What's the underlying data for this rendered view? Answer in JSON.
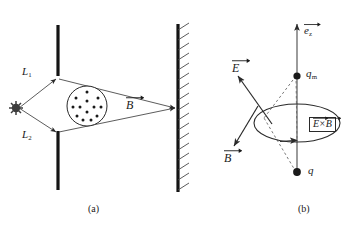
{
  "figure": {
    "background_color": "#ffffff",
    "ink_color": "#1a1a1a"
  },
  "panel_a": {
    "caption": "(a)",
    "labels": {
      "path_1": "L",
      "path_1_sub": "1",
      "path_2": "L",
      "path_2_sub": "2",
      "field_b": "B"
    },
    "elements": {
      "source_name": "point-source-burst",
      "barrier_name": "slit-barrier",
      "screen_name": "hatched-screen",
      "field_region_name": "magnetic-field-out-of-page",
      "field_dot_count": 13
    }
  },
  "panel_b": {
    "caption": "(b)",
    "labels": {
      "axis_unit": "e",
      "axis_unit_sub": "z",
      "field_e": "E",
      "field_b": "B",
      "charge_magnetic": "q",
      "charge_magnetic_sub": "m",
      "charge_electric": "q",
      "poynting_e": "E",
      "poynting_times": "×",
      "poynting_b": "B"
    },
    "elements": {
      "axis_name": "z-axis-arrow",
      "loop_name": "circulation-ellipse",
      "dashed_name": "dashed-connector-lines"
    }
  }
}
